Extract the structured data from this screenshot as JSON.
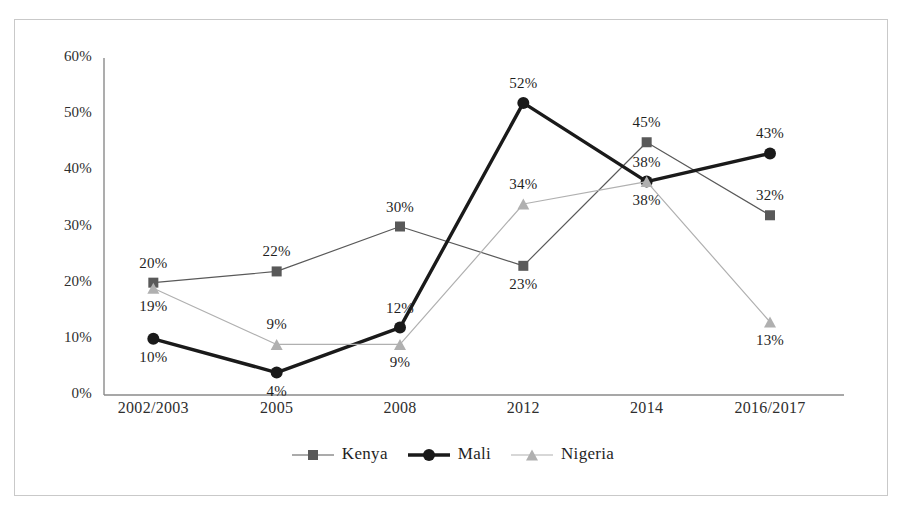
{
  "chart_data": {
    "type": "line",
    "title": "",
    "subtitle": "",
    "xlabel": "",
    "ylabel": "",
    "categories": [
      "2002/2003",
      "2005",
      "2008",
      "2012",
      "2014",
      "2016/2017"
    ],
    "ylim": [
      0,
      60
    ],
    "yticks": [
      0,
      10,
      20,
      30,
      40,
      50,
      60
    ],
    "ytick_labels": [
      "0%",
      "10%",
      "20%",
      "30%",
      "40%",
      "50%",
      "60%"
    ],
    "grid": false,
    "legend_position": "bottom",
    "value_labels_suffix": "%",
    "series": [
      {
        "name": "Kenya",
        "marker": "square",
        "color": "#595959",
        "line_width": 1.2,
        "values": [
          20,
          22,
          30,
          23,
          45,
          32
        ],
        "value_labels": [
          "20%",
          "22%",
          "30%",
          "23%",
          "45%",
          "32%"
        ],
        "label_positions": [
          "above",
          "above",
          "above",
          "below",
          "above",
          "above"
        ]
      },
      {
        "name": "Mali",
        "marker": "circle",
        "color": "#1a1a1a",
        "line_width": 3.4,
        "values": [
          10,
          4,
          12,
          52,
          38,
          43
        ],
        "value_labels": [
          "10%",
          "4%",
          "12%",
          "52%",
          "38%",
          "43%"
        ],
        "label_positions": [
          "below",
          "below",
          "above",
          "above",
          "below",
          "above"
        ]
      },
      {
        "name": "Nigeria",
        "marker": "triangle",
        "color": "#b0b0b0",
        "line_width": 1.2,
        "values": [
          19,
          9,
          9,
          34,
          38,
          13
        ],
        "value_labels": [
          "19%",
          "9%",
          "9%",
          "34%",
          "38%",
          "13%"
        ],
        "label_positions": [
          "below",
          "above",
          "below",
          "above",
          "above",
          "below"
        ]
      }
    ]
  },
  "legend": {
    "items": [
      {
        "label": "Kenya",
        "marker": "square-marker",
        "color": "#595959"
      },
      {
        "label": "Mali",
        "marker": "circle-marker",
        "color": "#1a1a1a"
      },
      {
        "label": "Nigeria",
        "marker": "triangle-marker",
        "color": "#b0b0b0"
      }
    ]
  },
  "axes": {
    "axis_color": "#8a8a8a",
    "frame_color": "#c9c9c9"
  }
}
